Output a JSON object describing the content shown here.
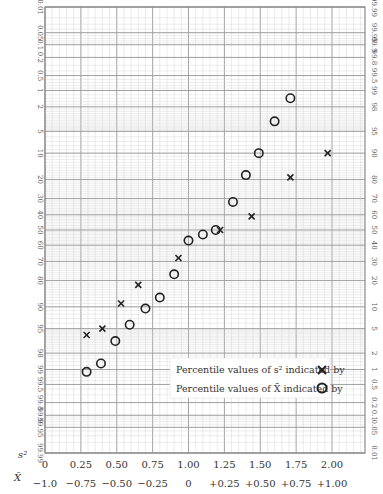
{
  "chart_data": {
    "type": "scatter",
    "title": "",
    "x_axis": {
      "rows": [
        {
          "symbol": "s²",
          "ticks": [
            "0",
            "0.25",
            "0.50",
            "0.75",
            "1.00",
            "1.25",
            "1.50",
            "1.75",
            "2.00"
          ],
          "range": [
            0,
            2.0
          ]
        },
        {
          "symbol": "X̄",
          "ticks": [
            "−1.0",
            "−0.75",
            "−0.50",
            "−0.25",
            "0",
            "+0.25",
            "+0.50",
            "+0.75",
            "+1.00"
          ],
          "range": [
            -1.0,
            1.0
          ]
        }
      ]
    },
    "y_axis": {
      "scale": "normal probability",
      "left_ticks": [
        "0.01",
        "0.05",
        "0.1",
        "0.2",
        "0.5",
        "1",
        "2",
        "5",
        "10",
        "20",
        "30",
        "40",
        "50",
        "60",
        "70",
        "80",
        "90",
        "95",
        "98",
        "99",
        "99.5",
        "99.8",
        "99.9",
        "99.95",
        "99.99"
      ],
      "right_ticks": [
        "99.99",
        "99.95",
        "99.9",
        "99.8",
        "99.5",
        "99",
        "98",
        "95",
        "90",
        "80",
        "70",
        "60",
        "50",
        "40",
        "30",
        "20",
        "10",
        "5",
        "2",
        "1",
        "0.5",
        "0.2",
        "0.1",
        "0.05",
        "0.01"
      ]
    },
    "grid": true,
    "legend": {
      "position": "lower right",
      "entries": [
        {
          "label": "Percentile values of s² indicated by",
          "marker": "cross"
        },
        {
          "label": "Percentile values of X̄ indicated by",
          "marker": "circle"
        }
      ]
    },
    "series": [
      {
        "name": "s²",
        "marker": "cross",
        "points_px": [
          [
            86,
            328
          ],
          [
            103,
            307
          ],
          [
            120,
            281
          ],
          [
            137,
            262
          ],
          [
            151,
            232
          ],
          [
            177,
            205
          ],
          [
            194,
            194
          ],
          [
            243,
            199
          ],
          [
            282,
            180
          ],
          [
            294,
            153
          ],
          [
            356,
            131
          ]
        ],
        "points": [
          {
            "x": 0.29,
            "left_pct": 96
          },
          {
            "x": 0.4,
            "left_pct": 95
          },
          {
            "x": 0.53,
            "left_pct": 89
          },
          {
            "x": 0.65,
            "left_pct": 82
          },
          {
            "x": 0.93,
            "left_pct": 68
          },
          {
            "x": 1.22,
            "left_pct": 50
          },
          {
            "x": 1.44,
            "left_pct": 41
          },
          {
            "x": 1.71,
            "left_pct": 19
          },
          {
            "x": 1.97,
            "left_pct": 10
          }
        ]
      },
      {
        "name": "X̄",
        "marker": "circle",
        "points": [
          {
            "x_xbar": -0.71,
            "left_pct": 99.1
          },
          {
            "x_xbar": -0.61,
            "left_pct": 98.7
          },
          {
            "x_xbar": -0.51,
            "left_pct": 96.8
          },
          {
            "x_xbar": -0.41,
            "left_pct": 94.3
          },
          {
            "x_xbar": -0.3,
            "left_pct": 90.5
          },
          {
            "x_xbar": -0.2,
            "left_pct": 87
          },
          {
            "x_xbar": -0.1,
            "left_pct": 77
          },
          {
            "x_xbar": 0.0,
            "left_pct": 57
          },
          {
            "x_xbar": 0.1,
            "left_pct": 53
          },
          {
            "x_xbar": 0.19,
            "left_pct": 50
          },
          {
            "x_xbar": 0.31,
            "left_pct": 32
          },
          {
            "x_xbar": 0.4,
            "left_pct": 18
          },
          {
            "x_xbar": 0.49,
            "left_pct": 10
          },
          {
            "x_xbar": 0.6,
            "left_pct": 3.5
          },
          {
            "x_xbar": 0.71,
            "left_pct": 1.4
          }
        ]
      }
    ]
  },
  "legend": {
    "s2_label": "Percentile values of s² indicated by",
    "xbar_label": "Percentile values of X̄ indicated by"
  },
  "axis_symbols": {
    "row1": "s²",
    "row2": "X̄"
  }
}
